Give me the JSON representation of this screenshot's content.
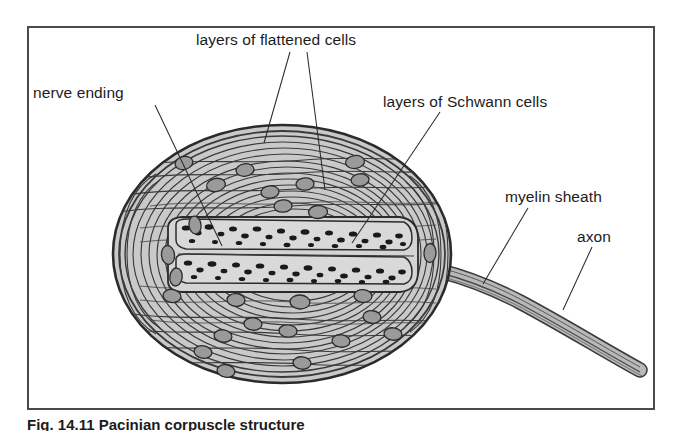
{
  "figure": {
    "caption": "Fig. 14.11   Pacinian corpuscle structure",
    "frame_color": "#4a4a4a",
    "background": "#ffffff"
  },
  "labels": [
    {
      "id": "flattened",
      "text": "layers of flattened cells"
    },
    {
      "id": "nerve_ending",
      "text": "nerve ending"
    },
    {
      "id": "schwann",
      "text": "layers of Schwann cells"
    },
    {
      "id": "myelin",
      "text": "myelin sheath"
    },
    {
      "id": "axon",
      "text": "axon"
    }
  ],
  "colors": {
    "lamella_stroke": "#3a3a3a",
    "lamella_fill": "#c9c9c9",
    "nucleus_fill": "#9a9a9a",
    "nucleus_stroke": "#2b2b2b",
    "granule_fill": "#1a1a1a",
    "core_fill": "#d4d4d4",
    "axon_fill": "#b8b8b8",
    "leader_line": "#2b2b2b",
    "text": "#1c1c1c"
  },
  "structure": {
    "corpuscle_shape": "oval",
    "lamella_count": 22,
    "nuclei_count": 26,
    "nerve_ending": "flattened central tube with granules",
    "axon_exit_side": "right"
  }
}
